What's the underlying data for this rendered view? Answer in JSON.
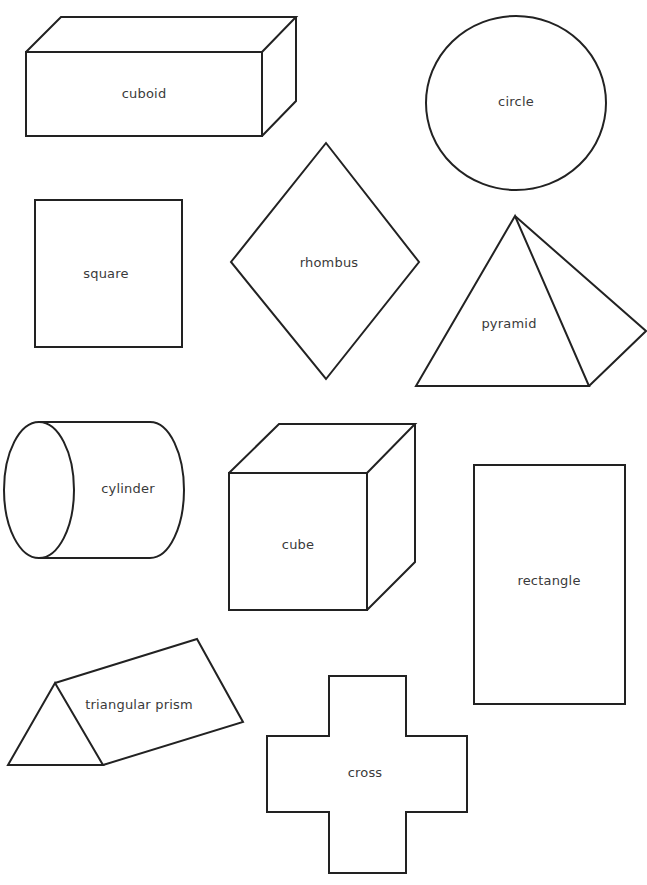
{
  "worksheet": {
    "stroke_color": "#222222",
    "label_color": "#3a3a3a",
    "background": "#ffffff",
    "shapes": [
      {
        "id": "cuboid",
        "label": "cuboid",
        "kind": "3d"
      },
      {
        "id": "circle",
        "label": "circle",
        "kind": "2d"
      },
      {
        "id": "square",
        "label": "square",
        "kind": "2d"
      },
      {
        "id": "rhombus",
        "label": "rhombus",
        "kind": "2d"
      },
      {
        "id": "pyramid",
        "label": "pyramid",
        "kind": "3d"
      },
      {
        "id": "cylinder",
        "label": "cylinder",
        "kind": "3d"
      },
      {
        "id": "cube",
        "label": "cube",
        "kind": "3d"
      },
      {
        "id": "rectangle",
        "label": "rectangle",
        "kind": "2d"
      },
      {
        "id": "triangular-prism",
        "label": "triangular prism",
        "kind": "3d"
      },
      {
        "id": "cross",
        "label": "cross",
        "kind": "2d"
      }
    ]
  }
}
